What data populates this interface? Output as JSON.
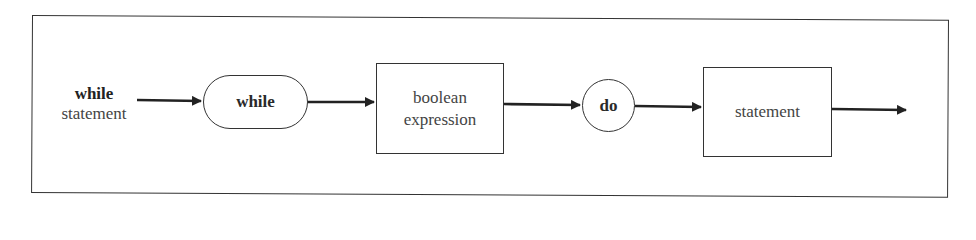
{
  "diagram": {
    "type": "syntax-diagram",
    "entry_label": {
      "keyword": "while",
      "name": "statement"
    },
    "nodes": [
      {
        "id": "while",
        "label": "while",
        "shape": "rounded-terminal",
        "bold": true
      },
      {
        "id": "boolean-expression",
        "label_lines": [
          "boolean",
          "expression"
        ],
        "shape": "rectangle-nonterminal"
      },
      {
        "id": "do",
        "label": "do",
        "shape": "circle-terminal",
        "bold": true
      },
      {
        "id": "statement",
        "label": "statement",
        "shape": "rectangle-nonterminal"
      }
    ],
    "edges": [
      {
        "from": "entry",
        "to": "while"
      },
      {
        "from": "while",
        "to": "boolean-expression"
      },
      {
        "from": "boolean-expression",
        "to": "do"
      },
      {
        "from": "do",
        "to": "statement"
      },
      {
        "from": "statement",
        "to": "exit"
      }
    ],
    "colors": {
      "stroke": "#333333",
      "background": "#ffffff",
      "text": "#2a2a2a"
    }
  }
}
